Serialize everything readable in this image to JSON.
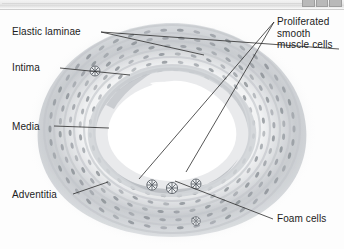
{
  "window": {
    "chrome_visible": true,
    "buttons": [
      "minimize",
      "maximize",
      "close"
    ]
  },
  "figure": {
    "background_color": "#fdfdfd",
    "ink_color": "#1c1c1c",
    "tissue_color": "#b9bcc0",
    "nucleus_color": "#7a7f86",
    "lumen_color": "#ffffff"
  },
  "labels": {
    "elastic_laminae": "Elastic laminae",
    "intima": "Intima",
    "media": "Media",
    "adventitia": "Adventitia",
    "proliferated_smooth_muscle_cells": "Proliferated\nsmooth\nmuscle cells",
    "foam_cells": "Foam cells"
  },
  "structures": {
    "lumen": "lumen",
    "plaque": "atherosclerotic plaque",
    "foam_cell_clusters": 4,
    "elastic_lamina_bands": 2
  }
}
